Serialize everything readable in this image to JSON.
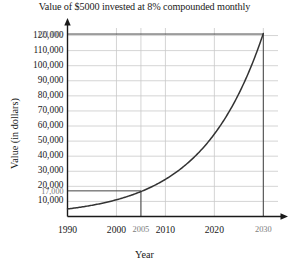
{
  "chart_data": {
    "type": "line",
    "title": "Value of $5000 invested at 8% compounded monthly",
    "xlabel": "Year",
    "ylabel": "Value (in dollars)",
    "xlim": [
      1990,
      2033
    ],
    "ylim": [
      0,
      125000
    ],
    "grid": true,
    "legend": null,
    "x_ticks": [
      {
        "value": 1990,
        "label": "1990",
        "emphasis": "major"
      },
      {
        "value": 2000,
        "label": "2000",
        "emphasis": "major"
      },
      {
        "value": 2005,
        "label": "2005",
        "emphasis": "minor"
      },
      {
        "value": 2010,
        "label": "2010",
        "emphasis": "major"
      },
      {
        "value": 2020,
        "label": "2020",
        "emphasis": "major"
      },
      {
        "value": 2030,
        "label": "2030",
        "emphasis": "minor"
      }
    ],
    "y_ticks": [
      {
        "value": 10000,
        "label": "10,000",
        "emphasis": "major"
      },
      {
        "value": 17000,
        "label": "17,000",
        "emphasis": "minor"
      },
      {
        "value": 20000,
        "label": "20,000",
        "emphasis": "major"
      },
      {
        "value": 30000,
        "label": "30,000",
        "emphasis": "major"
      },
      {
        "value": 40000,
        "label": "40,000",
        "emphasis": "major"
      },
      {
        "value": 50000,
        "label": "50,000",
        "emphasis": "major"
      },
      {
        "value": 60000,
        "label": "60,000",
        "emphasis": "major"
      },
      {
        "value": 70000,
        "label": "70,000",
        "emphasis": "major"
      },
      {
        "value": 80000,
        "label": "80,000",
        "emphasis": "major"
      },
      {
        "value": 90000,
        "label": "90,000",
        "emphasis": "major"
      },
      {
        "value": 100000,
        "label": "100,000",
        "emphasis": "major"
      },
      {
        "value": 110000,
        "label": "110,000",
        "emphasis": "major"
      },
      {
        "value": 120000,
        "label": "120,000",
        "emphasis": "major"
      },
      {
        "value": 121000,
        "label": "121,000",
        "emphasis": "minor"
      }
    ],
    "gridlines_y": [
      10000,
      20000,
      30000,
      40000,
      50000,
      60000,
      70000,
      80000,
      90000,
      100000,
      110000,
      120000
    ],
    "gridlines_x": [
      2000,
      2005,
      2010,
      2020,
      2030
    ],
    "series": [
      {
        "name": "Value of $5000 at 8% compounded monthly",
        "formula": "5000 * (1 + 0.08/12)^(12*(year-1990))",
        "principal": 5000,
        "rate": 0.08,
        "compounds_per_year": 12,
        "start_year": 1990,
        "color": "#333333",
        "points": [
          {
            "x": 1990,
            "y": 5000
          },
          {
            "x": 1995,
            "y": 7449
          },
          {
            "x": 2000,
            "y": 11098
          },
          {
            "x": 2005,
            "y": 16534
          },
          {
            "x": 2010,
            "y": 24632
          },
          {
            "x": 2015,
            "y": 36697
          },
          {
            "x": 2020,
            "y": 54674
          },
          {
            "x": 2025,
            "y": 81454
          },
          {
            "x": 2030,
            "y": 121345
          }
        ]
      }
    ],
    "annotations": [
      {
        "type": "drop-line",
        "x": 2005,
        "y": 17000,
        "label_x": "2005",
        "label_y": "17,000",
        "color": "#333333"
      },
      {
        "type": "drop-line",
        "x": 2030,
        "y": 121000,
        "label_x": "2030",
        "label_y": "121,000",
        "color": "#333333"
      }
    ],
    "colors": {
      "curve": "#333333",
      "axis": "#1a1a1a",
      "grid": "#c9c9c9",
      "guide": "#444444",
      "minor_text": "#7d7d7d"
    }
  }
}
